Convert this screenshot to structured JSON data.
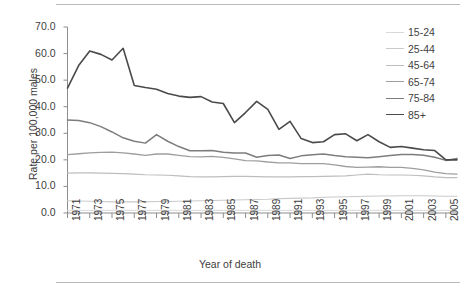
{
  "figure": {
    "rule_top": "horizontal-rule",
    "rule_bottom": "horizontal-rule"
  },
  "chart_data": {
    "type": "line",
    "title": "",
    "xlabel": "Year of death",
    "ylabel": "Rate per 100,000 males",
    "xlim": [
      1971,
      2006
    ],
    "ylim": [
      0,
      70
    ],
    "ytick_labels": [
      "70.0",
      "60.0",
      "50.0",
      "40.0",
      "30.0",
      "20.0",
      "10.0",
      "0.0"
    ],
    "ytick_values": [
      70,
      60,
      50,
      40,
      30,
      20,
      10,
      0
    ],
    "xtick_labels": [
      "1971",
      "1973",
      "1975",
      "1977",
      "1979",
      "1981",
      "1983",
      "1985",
      "1987",
      "1989",
      "1991",
      "1993",
      "1995",
      "1997",
      "1999",
      "2001",
      "2003",
      "2005"
    ],
    "xtick_values": [
      1971,
      1973,
      1975,
      1977,
      1979,
      1981,
      1983,
      1985,
      1987,
      1989,
      1991,
      1993,
      1995,
      1997,
      1999,
      2001,
      2003,
      2005
    ],
    "grid": false,
    "legend_position": "top-right",
    "x": [
      1971,
      1972,
      1973,
      1974,
      1975,
      1976,
      1977,
      1978,
      1979,
      1980,
      1981,
      1982,
      1983,
      1984,
      1985,
      1986,
      1987,
      1988,
      1989,
      1990,
      1991,
      1992,
      1993,
      1994,
      1995,
      1996,
      1997,
      1998,
      1999,
      2000,
      2001,
      2002,
      2003,
      2004,
      2005,
      2006
    ],
    "series": [
      {
        "name": "15-24",
        "color": "#d8d8d8",
        "width": 1.0,
        "values": [
          1.0,
          1.0,
          1.0,
          1.0,
          1.0,
          1.0,
          1.0,
          1.0,
          1.0,
          1.0,
          1.0,
          1.0,
          1.0,
          1.0,
          1.0,
          1.0,
          1.0,
          1.0,
          1.0,
          1.0,
          1.0,
          1.0,
          1.0,
          1.0,
          1.0,
          1.0,
          1.0,
          1.0,
          1.0,
          1.0,
          1.0,
          1.0,
          1.0,
          1.0,
          1.0,
          1.0
        ]
      },
      {
        "name": "25-44",
        "color": "#cacaca",
        "width": 1.1,
        "values": [
          4.6,
          4.5,
          4.4,
          4.3,
          4.2,
          4.2,
          4.2,
          4.2,
          4.3,
          4.3,
          4.4,
          4.5,
          4.6,
          4.7,
          4.8,
          4.9,
          5.0,
          5.1,
          5.2,
          5.4,
          5.5,
          5.6,
          5.7,
          5.9,
          6.0,
          6.1,
          6.2,
          6.3,
          6.4,
          6.4,
          6.5,
          6.5,
          6.5,
          6.4,
          6.3,
          6.3
        ]
      },
      {
        "name": "45-64",
        "color": "#bdbdbd",
        "width": 1.2,
        "values": [
          15.0,
          15.1,
          15.1,
          15.0,
          14.9,
          14.8,
          14.6,
          14.4,
          14.3,
          14.2,
          14.0,
          13.7,
          13.6,
          13.6,
          13.7,
          13.8,
          13.8,
          13.7,
          13.6,
          13.6,
          13.6,
          13.7,
          13.7,
          13.8,
          13.9,
          14.0,
          14.3,
          14.6,
          14.4,
          14.3,
          14.3,
          14.2,
          14.0,
          13.6,
          13.3,
          13.3
        ]
      },
      {
        "name": "65-74",
        "color": "#9e9e9e",
        "width": 1.3,
        "values": [
          22.0,
          22.3,
          22.6,
          22.8,
          22.9,
          22.6,
          22.2,
          21.7,
          22.2,
          22.2,
          21.7,
          21.2,
          21.1,
          21.3,
          20.9,
          20.4,
          19.7,
          19.6,
          19.2,
          18.9,
          18.9,
          18.6,
          18.6,
          18.6,
          18.1,
          17.5,
          17.2,
          17.3,
          17.4,
          17.2,
          17.2,
          16.8,
          16.2,
          15.4,
          14.8,
          14.6
        ]
      },
      {
        "name": "75-84",
        "color": "#7d7d7d",
        "width": 1.5,
        "values": [
          35.0,
          34.8,
          34.0,
          32.5,
          30.5,
          28.3,
          27.0,
          26.3,
          29.5,
          27.0,
          25.0,
          23.4,
          23.4,
          23.5,
          22.9,
          22.6,
          22.6,
          21.0,
          21.6,
          21.8,
          20.5,
          21.5,
          21.9,
          22.2,
          21.6,
          21.2,
          21.0,
          20.8,
          21.2,
          21.6,
          22.0,
          22.0,
          21.7,
          21.0,
          19.8,
          20.5
        ]
      },
      {
        "name": "85+",
        "color": "#4a4a4a",
        "width": 1.6,
        "values": [
          47.0,
          55.5,
          61.0,
          59.7,
          57.6,
          62.0,
          48.0,
          47.2,
          46.6,
          45.0,
          44.0,
          43.5,
          43.8,
          41.8,
          41.2,
          34.0,
          37.8,
          42.0,
          39.0,
          31.5,
          34.5,
          28.0,
          26.5,
          26.8,
          29.5,
          29.8,
          27.2,
          29.5,
          26.8,
          24.7,
          25.0,
          24.4,
          23.8,
          23.5,
          20.0,
          20.0
        ]
      }
    ]
  }
}
